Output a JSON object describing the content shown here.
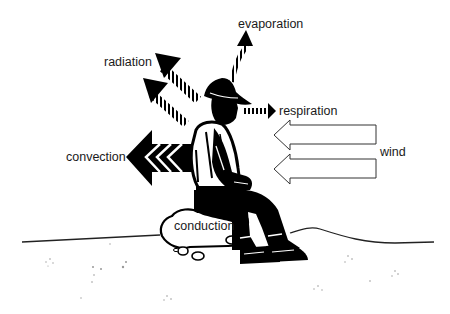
{
  "diagram": {
    "labels": {
      "evaporation": "evaporation",
      "radiation": "radiation",
      "respiration": "respiration",
      "convection": "convection",
      "wind": "wind",
      "conduction": "conduction"
    },
    "arrows": [
      {
        "name": "evaporation",
        "style": "striped-black",
        "direction": "up"
      },
      {
        "name": "radiation",
        "count": 2,
        "style": "striped-black",
        "direction": "up-left"
      },
      {
        "name": "respiration",
        "style": "striped-black",
        "direction": "right"
      },
      {
        "name": "convection",
        "style": "chevron-black",
        "direction": "left"
      },
      {
        "name": "wind",
        "count": 2,
        "style": "outline-white",
        "direction": "left"
      }
    ],
    "colors": {
      "ink": "#000000",
      "background": "#ffffff",
      "text": "#1a1a1a"
    }
  }
}
